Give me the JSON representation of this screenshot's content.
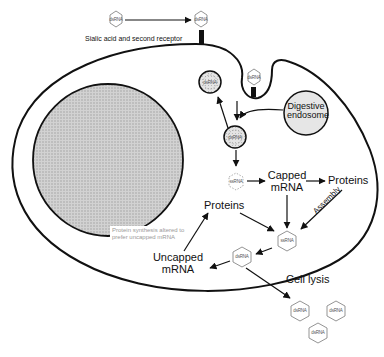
{
  "diagram": {
    "type": "viral-replication-cycle",
    "labels": {
      "receptor": "Sialic acid and second receptor",
      "digestive_endosome": [
        "Digestive",
        "endosome"
      ],
      "capped_mrna": [
        "Capped",
        "mRNA"
      ],
      "proteins_right": "Proteins",
      "proteins_left": "Proteins",
      "assembly": "Assembly",
      "uncapped_mrna": [
        "Uncapped",
        "mRNA"
      ],
      "cell_lysis": "Cell lysis",
      "note": [
        "Protein synthesis altered to",
        "prefer uncapped mRNA"
      ]
    },
    "particles": {
      "dsrna": "dsRNA",
      "ssrna": "ssRNA"
    },
    "colors": {
      "line": "#111111",
      "nucleus_fill": "#c8c8c8",
      "endosome_fill": "#e6e6e6",
      "hex_stroke": "#888888",
      "note_text": "#9a9a9a"
    }
  }
}
